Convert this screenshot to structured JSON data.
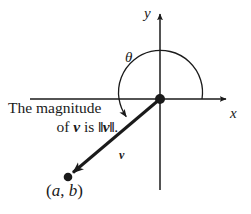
{
  "figure": {
    "title_text": "Vector v in standard position with direction angle theta",
    "background_color": "#ffffff",
    "stroke_color": "#1a1a1a"
  },
  "axes": {
    "x_label": "x",
    "y_label": "y",
    "origin_px": [
      160,
      99
    ],
    "x_axis_from_px": [
      30,
      99
    ],
    "x_axis_to_px": [
      228,
      99
    ],
    "y_axis_from_px": [
      160,
      190
    ],
    "y_axis_to_px": [
      160,
      12
    ]
  },
  "angle": {
    "symbol": "θ",
    "arc_start_label": "positive x-axis",
    "arc_direction": "counterclockwise",
    "arc_radius_px": 42
  },
  "vector": {
    "label": "v",
    "tail_px": [
      160,
      99
    ],
    "head_px": [
      68,
      177
    ],
    "terminal_point_label_open": "(",
    "terminal_point_label": "a, b",
    "terminal_point_label_close": ")",
    "terminal_point_a": "a",
    "terminal_point_b": "b",
    "terminal_point_separator": ", "
  },
  "caption": {
    "line1": "The magnitude",
    "line2_prefix": "of ",
    "line2_vector": "v",
    "line2_mid": " is ",
    "line2_norm_open": "‖",
    "line2_norm_vector": "v",
    "line2_norm_close": "‖",
    "line2_period": "."
  }
}
